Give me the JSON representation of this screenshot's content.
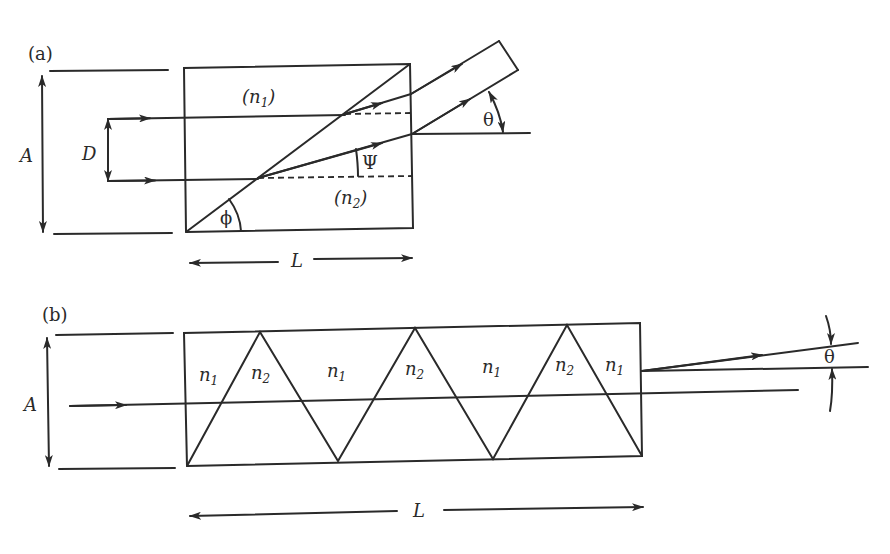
{
  "figure": {
    "panel_a": {
      "label": "(a)",
      "aperture_label": "A",
      "separation_label": "D",
      "length_label": "L",
      "region_upper": {
        "open": "(",
        "n": "n",
        "sub": "1",
        "close": ")"
      },
      "region_lower": {
        "open": "(",
        "n": "n",
        "sub": "2",
        "close": ")"
      },
      "angle_prism": "ϕ",
      "angle_refraction": "Ψ",
      "angle_output": "θ"
    },
    "panel_b": {
      "label": "(b)",
      "aperture_label": "A",
      "length_label": "L",
      "angle_output": "θ",
      "regions": [
        {
          "n": "n",
          "sub": "1"
        },
        {
          "n": "n",
          "sub": "2"
        },
        {
          "n": "n",
          "sub": "1"
        },
        {
          "n": "n",
          "sub": "2"
        },
        {
          "n": "n",
          "sub": "1"
        },
        {
          "n": "n",
          "sub": "2"
        },
        {
          "n": "n",
          "sub": "1"
        }
      ]
    },
    "colors": {
      "ink": "#2a2a2a",
      "background": "#ffffff"
    }
  }
}
